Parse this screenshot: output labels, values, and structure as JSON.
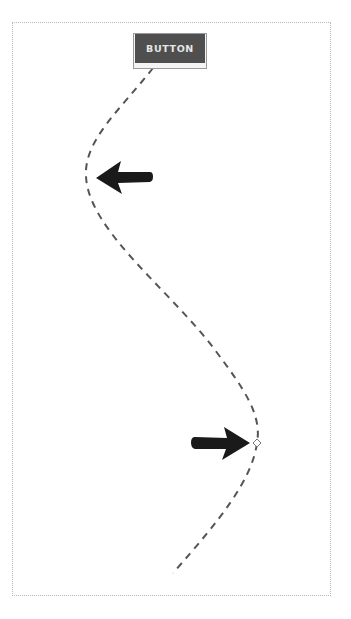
{
  "diagram": {
    "button": {
      "label": "BUTTON",
      "fill_color": "#4f4f4f",
      "text_color": "#e6e6e6"
    },
    "path": {
      "style": "dashed",
      "color": "#555555",
      "start": [
        153,
        68
      ],
      "leftmost_point": [
        86,
        176
      ],
      "rightmost_point": [
        257,
        443
      ],
      "end": [
        173,
        573
      ]
    },
    "arrows": [
      {
        "direction": "left",
        "tip": [
          96,
          178
        ],
        "color": "#1a1a1a"
      },
      {
        "direction": "right",
        "tip": [
          250,
          443
        ],
        "color": "#1a1a1a"
      }
    ],
    "marker": {
      "shape": "diamond",
      "position": [
        257,
        443
      ]
    },
    "frame": {
      "border_style": "dotted",
      "border_color": "#b8b8b8"
    }
  }
}
